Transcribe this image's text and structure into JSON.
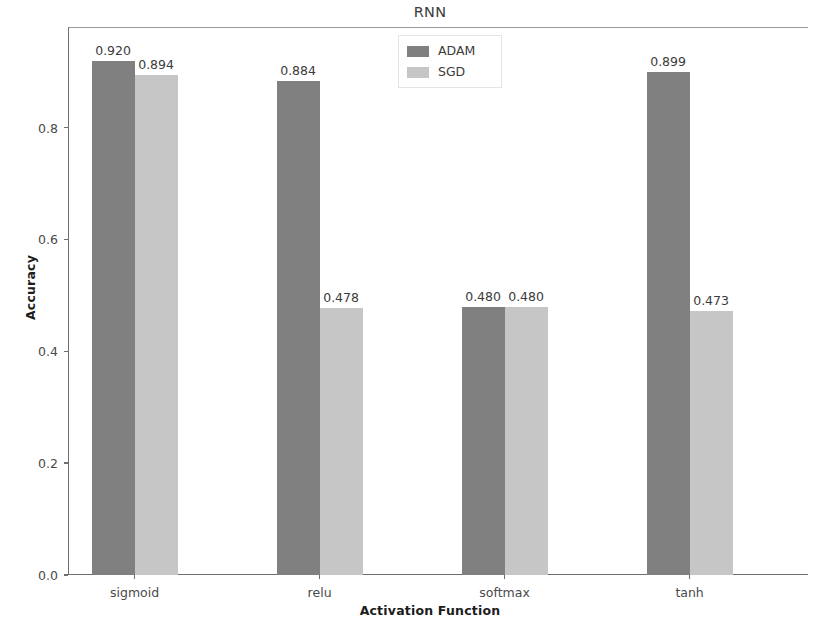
{
  "chart_data": {
    "type": "bar",
    "title": "RNN",
    "xlabel": "Activation Function",
    "ylabel": "Accuracy",
    "categories": [
      "sigmoid",
      "relu",
      "softmax",
      "tanh"
    ],
    "series": [
      {
        "name": "ADAM",
        "color": "#808080",
        "values": [
          0.92,
          0.884,
          0.48,
          0.899
        ],
        "labels": [
          "0.920",
          "0.884",
          "0.480",
          "0.899"
        ]
      },
      {
        "name": "SGD",
        "color": "#c6c6c6",
        "values": [
          0.894,
          0.478,
          0.48,
          0.473
        ],
        "labels": [
          "0.894",
          "0.478",
          "0.480",
          "0.473"
        ]
      }
    ],
    "ylim": [
      0.0,
      0.98
    ],
    "ytick_labels": [
      "0.0",
      "0.2",
      "0.4",
      "0.6",
      "0.8"
    ],
    "ytick_values": [
      0.0,
      0.2,
      0.4,
      0.6,
      0.8
    ],
    "grid": false,
    "legend_position": "upper center"
  },
  "axes": {
    "title": "RNN",
    "xlabel": "Activation Function",
    "ylabel": "Accuracy"
  },
  "legend": {
    "entries": [
      {
        "label": "ADAM",
        "color": "#808080"
      },
      {
        "label": "SGD",
        "color": "#c6c6c6"
      }
    ]
  }
}
